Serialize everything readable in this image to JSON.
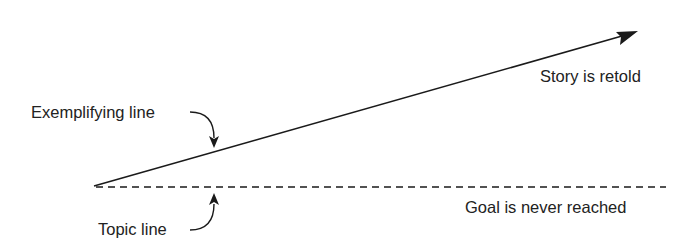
{
  "diagram": {
    "labels": {
      "exemplifying_line": "Exemplifying line",
      "topic_line": "Topic line",
      "story_retold": "Story is retold",
      "goal_never_reached": "Goal is never reached"
    },
    "lines": {
      "exemplifying": {
        "style": "solid",
        "from": [
          94,
          186
        ],
        "to": [
          638,
          31
        ],
        "arrowhead": true
      },
      "topic": {
        "style": "dashed",
        "from": [
          94,
          187
        ],
        "to": [
          666,
          187
        ]
      }
    },
    "colors": {
      "stroke": "#1a1a1a",
      "text": "#222222",
      "background": "#ffffff"
    }
  }
}
